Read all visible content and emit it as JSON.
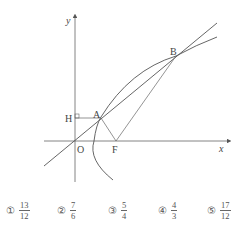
{
  "diagram": {
    "axis_labels": {
      "x": "x",
      "y": "y"
    },
    "points": {
      "origin": "O",
      "A": "A",
      "B": "B",
      "F": "F",
      "H": "H"
    },
    "stroke_color": "#555555"
  },
  "choices": [
    {
      "marker": "①",
      "numerator": "13",
      "denominator": "12"
    },
    {
      "marker": "②",
      "numerator": "7",
      "denominator": "6"
    },
    {
      "marker": "③",
      "numerator": "5",
      "denominator": "4"
    },
    {
      "marker": "④",
      "numerator": "4",
      "denominator": "3"
    },
    {
      "marker": "⑤",
      "numerator": "17",
      "denominator": "12"
    }
  ]
}
